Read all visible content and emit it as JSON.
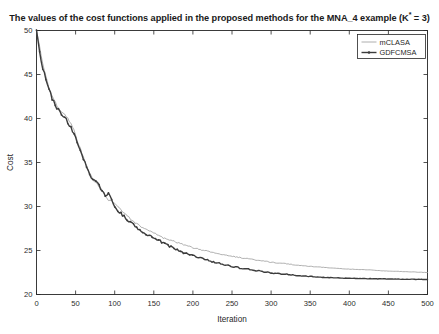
{
  "figure": {
    "title_prefix": "The values of the cost functions applied in the proposed methods for the MNA_4 example (K",
    "title_superscript": "*",
    "title_suffix": " = 3)",
    "title_full": "The values of the cost functions applied in the proposed methods for the MNA_4 example (K* = 3)",
    "background_color": "#ffffff",
    "axis_color": "#262626"
  },
  "chart_data": {
    "type": "line",
    "title": "The values of the cost functions applied in the proposed methods for the MNA_4 example (K* = 3)",
    "xlabel": "Iteration",
    "ylabel": "Cost",
    "xlim": [
      0,
      500
    ],
    "ylim": [
      20,
      50
    ],
    "xticks": [
      0,
      50,
      100,
      150,
      200,
      250,
      300,
      350,
      400,
      450,
      500
    ],
    "yticks": [
      20,
      25,
      30,
      35,
      40,
      45,
      50
    ],
    "xtick_labels": [
      "0",
      "50",
      "100",
      "150",
      "200",
      "250",
      "300",
      "350",
      "400",
      "450",
      "500"
    ],
    "ytick_labels": [
      "20",
      "25",
      "30",
      "35",
      "40",
      "45",
      "50"
    ],
    "grid": false,
    "legend_position": "upper right",
    "legend_entries": [
      "mCLASA",
      "GDFCMSA"
    ],
    "x": [
      0,
      2,
      4,
      6,
      8,
      10,
      12,
      14,
      16,
      18,
      20,
      24,
      28,
      32,
      36,
      40,
      44,
      48,
      52,
      56,
      60,
      64,
      68,
      72,
      76,
      80,
      84,
      88,
      92,
      96,
      100,
      108,
      116,
      124,
      132,
      140,
      150,
      160,
      170,
      180,
      190,
      200,
      215,
      230,
      245,
      260,
      275,
      290,
      305,
      320,
      335,
      350,
      365,
      380,
      395,
      410,
      425,
      440,
      455,
      470,
      485,
      500
    ],
    "series": [
      {
        "name": "mCLASA",
        "color": "#9a9a9a",
        "line_style": "solid",
        "line_width": 0.8,
        "marker": "none",
        "values": [
          50.0,
          49.2,
          48.2,
          47.0,
          46.2,
          45.4,
          44.7,
          44.1,
          43.5,
          43.0,
          42.5,
          41.8,
          41.2,
          40.8,
          40.5,
          40.0,
          39.4,
          38.6,
          37.6,
          36.6,
          35.6,
          34.6,
          33.7,
          33.1,
          32.7,
          32.3,
          31.8,
          31.1,
          30.6,
          30.6,
          30.4,
          29.6,
          28.9,
          28.3,
          27.8,
          27.4,
          27.0,
          26.5,
          26.2,
          25.9,
          25.6,
          25.3,
          25.0,
          24.7,
          24.4,
          24.2,
          24.0,
          23.8,
          23.6,
          23.5,
          23.3,
          23.2,
          23.1,
          23.0,
          22.9,
          22.85,
          22.8,
          22.7,
          22.65,
          22.6,
          22.55,
          22.5
        ]
      },
      {
        "name": "GDFCMSA",
        "color": "#3c3c3c",
        "line_style": "solid-with-markers",
        "line_width": 1.4,
        "marker": "dot",
        "values": [
          50.0,
          48.8,
          47.6,
          46.6,
          45.8,
          45.1,
          44.4,
          43.8,
          43.3,
          42.8,
          42.3,
          41.5,
          41.0,
          40.6,
          40.1,
          39.6,
          39.0,
          38.2,
          37.3,
          36.4,
          35.4,
          34.5,
          33.6,
          33.2,
          32.9,
          32.4,
          31.7,
          31.3,
          31.4,
          30.9,
          30.0,
          29.2,
          28.5,
          28.0,
          27.3,
          26.9,
          26.4,
          26.0,
          25.5,
          25.1,
          24.7,
          24.4,
          24.0,
          23.6,
          23.3,
          23.0,
          22.8,
          22.6,
          22.4,
          22.3,
          22.15,
          22.05,
          21.95,
          21.9,
          21.85,
          21.82,
          21.8,
          21.78,
          21.76,
          21.74,
          21.72,
          21.7
        ]
      }
    ]
  }
}
